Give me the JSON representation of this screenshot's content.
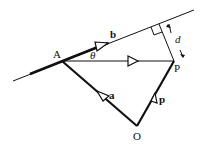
{
  "diagram": {
    "points": {
      "A": {
        "label": "A",
        "x": 62,
        "y": 61
      },
      "P": {
        "label": "P",
        "x": 174,
        "y": 61
      },
      "O": {
        "label": "O",
        "x": 137,
        "y": 126
      }
    },
    "vectors": {
      "a": {
        "label": "a",
        "from": "O",
        "to": "A"
      },
      "p": {
        "label": "p",
        "from": "O",
        "to": "P"
      },
      "b": {
        "label": "b",
        "along": "line through A"
      }
    },
    "angle": {
      "label": "θ",
      "at": "A"
    },
    "distance": {
      "label": "d",
      "from": "P",
      "to": "line"
    },
    "colors": {
      "stroke": "#111111",
      "background": "#ffffff"
    }
  }
}
